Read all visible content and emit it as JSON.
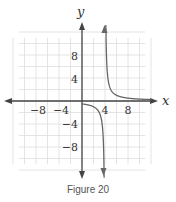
{
  "chart_data": {
    "type": "line",
    "title": "",
    "caption": "Figure 20",
    "xlabel": "x",
    "ylabel": "y",
    "xlim": [
      -12,
      12
    ],
    "ylim": [
      -12,
      12
    ],
    "grid": true,
    "grid_step": 2,
    "x_ticks": [
      -8,
      -4,
      4,
      8
    ],
    "x_tick_labels": [
      "−8",
      "−4",
      "4",
      "8"
    ],
    "y_ticks": [
      8,
      4,
      -4,
      -8
    ],
    "y_tick_labels": [
      "8",
      "4",
      "−4",
      "−8"
    ],
    "series": [
      {
        "name": "f(x)",
        "equation": "y = 2/(x − 4)",
        "vertical_asymptote": 4,
        "horizontal_asymptote": 0,
        "points": [
          [
            -12,
            -0.125
          ],
          [
            -8,
            -0.167
          ],
          [
            -4,
            -0.25
          ],
          [
            0,
            -0.5
          ],
          [
            2,
            -1
          ],
          [
            3,
            -2
          ],
          [
            3.5,
            -4
          ],
          [
            3.8,
            -10
          ],
          [
            4.2,
            10
          ],
          [
            4.5,
            4
          ],
          [
            5,
            2
          ],
          [
            6,
            1
          ],
          [
            8,
            0.5
          ],
          [
            12,
            0.25
          ]
        ]
      }
    ],
    "colors": {
      "axis": "#444444",
      "grid": "#dddddd",
      "curve": "#666666"
    }
  }
}
